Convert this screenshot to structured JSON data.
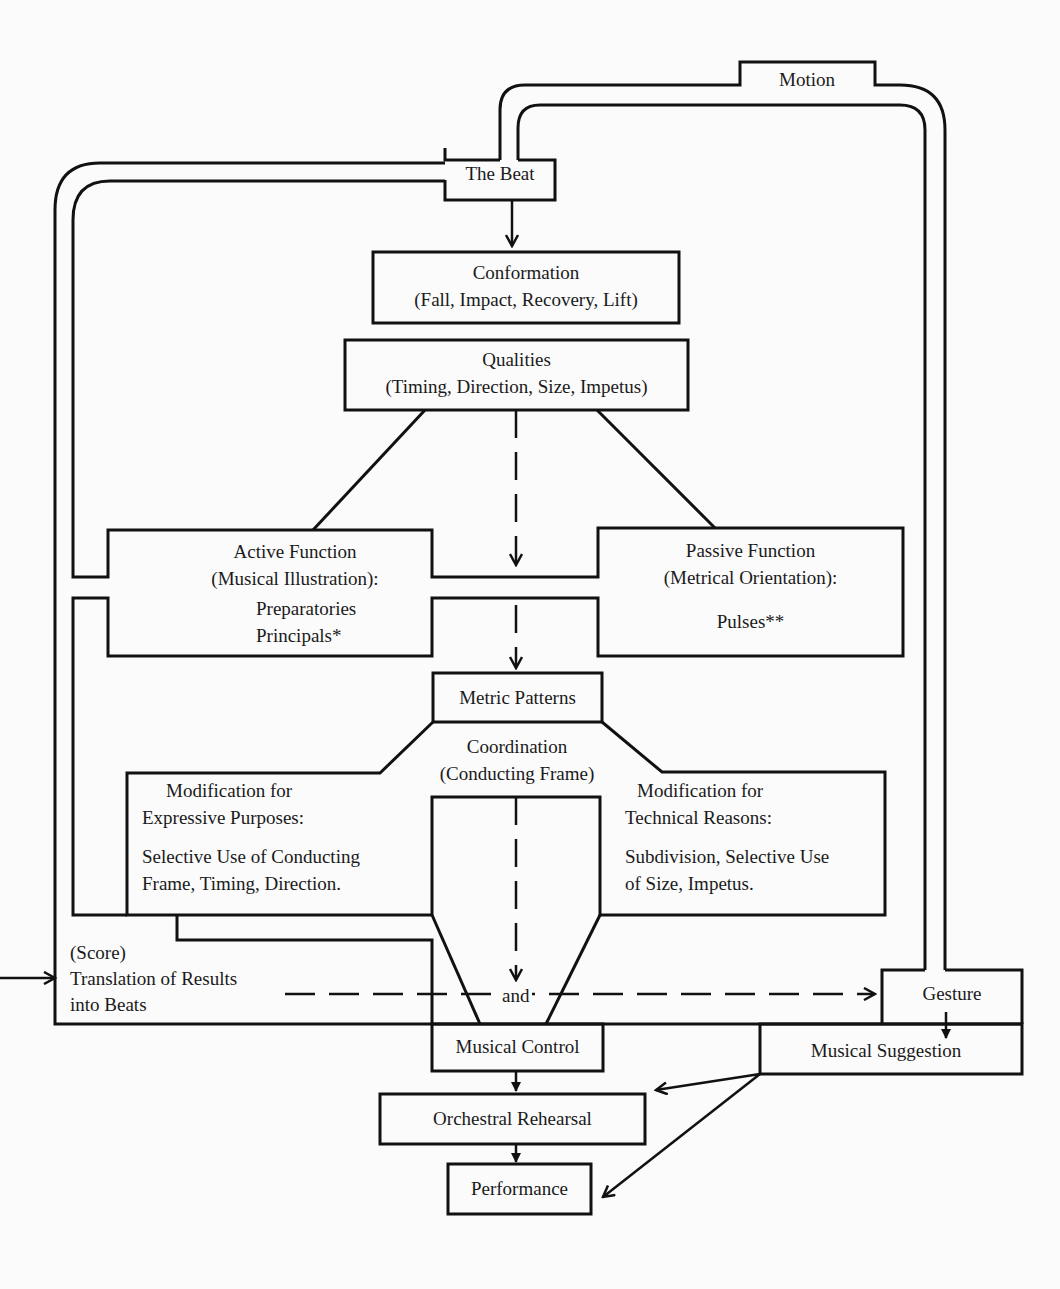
{
  "diagram": {
    "title": "Motion",
    "nodes": {
      "motion": "Motion",
      "beat": "The Beat",
      "conformation": {
        "title": "Conformation",
        "sub": "(Fall, Impact, Recovery, Lift)"
      },
      "qualities": {
        "title": "Qualities",
        "sub": "(Timing, Direction, Size, Impetus)"
      },
      "active": {
        "title": "Active Function",
        "sub": "(Musical Illustration):",
        "items": [
          "Preparatories",
          "Principals*"
        ]
      },
      "passive": {
        "title": "Passive Function",
        "sub": "(Metrical Orientation):",
        "items": [
          "Pulses**"
        ]
      },
      "metric": "Metric Patterns",
      "coordination": {
        "title": "Coordination",
        "sub": "(Conducting Frame)"
      },
      "expressive": {
        "title": "Modification for",
        "sub": "Expressive Purposes:",
        "body1": "Selective Use  of Conducting",
        "body2": "Frame, Timing,  Direction."
      },
      "technical": {
        "title": "Modification for",
        "sub": "Technical Reasons:",
        "body1": "Subdivision, Selective Use",
        "body2": "of Size,  Impetus."
      },
      "score": {
        "line1": "(Score)",
        "line2": "Translation of Results",
        "line3": "into Beats"
      },
      "and": "and",
      "gesture": "Gesture",
      "control": "Musical Control",
      "suggestion": "Musical Suggestion",
      "rehearsal": "Orchestral Rehearsal",
      "performance": "Performance"
    },
    "colors": {
      "line": "#111111",
      "background": "#fbfbfb"
    }
  }
}
